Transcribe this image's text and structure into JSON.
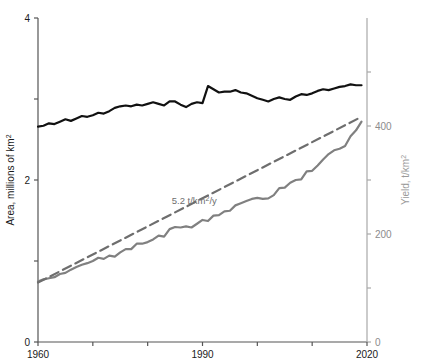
{
  "chart_data": {
    "type": "line",
    "title": "",
    "xlabel": "",
    "xlim": [
      1960,
      2020
    ],
    "xticks": [
      1960,
      1970,
      1980,
      1990,
      2000,
      2010,
      2020
    ],
    "xticklabels": [
      "1960",
      "",
      "",
      "1990",
      "",
      "",
      "2020"
    ],
    "grid": false,
    "legend": false,
    "axes": [
      {
        "id": "left",
        "label": "Area, millions of km²",
        "unit": "millions of km²",
        "lim": [
          0,
          4
        ],
        "ticks": [
          0,
          1,
          2,
          3,
          4
        ],
        "ticklabels": [
          "0",
          "",
          "2",
          "",
          "4"
        ],
        "color": "#1a1a1a"
      },
      {
        "id": "right",
        "label": "Yield, t/km²",
        "unit": "t/km²",
        "lim": [
          0,
          600
        ],
        "ticks": [
          0,
          100,
          200,
          300,
          400,
          500
        ],
        "ticklabels": [
          "0",
          "",
          "200",
          "",
          "400",
          ""
        ],
        "color": "#9a9a9a"
      }
    ],
    "annotations": [
      {
        "name": "trend-slope-label",
        "text": "5.2 t/km²/y",
        "x": 1988.5,
        "y_right": 255,
        "color": "#6e6e6e"
      }
    ],
    "series": [
      {
        "name": "Area",
        "axis": "left",
        "color": "#111111",
        "style": "solid",
        "width": 2.2,
        "x": [
          1960,
          1961,
          1962,
          1963,
          1964,
          1965,
          1966,
          1967,
          1968,
          1969,
          1970,
          1971,
          1972,
          1973,
          1974,
          1975,
          1976,
          1977,
          1978,
          1979,
          1980,
          1981,
          1982,
          1983,
          1984,
          1985,
          1986,
          1987,
          1988,
          1989,
          1990,
          1991,
          1992,
          1993,
          1994,
          1995,
          1996,
          1997,
          1998,
          1999,
          2000,
          2001,
          2002,
          2003,
          2004,
          2005,
          2006,
          2007,
          2008,
          2009,
          2010,
          2011,
          2012,
          2013,
          2014,
          2015,
          2016,
          2017,
          2018,
          2019
        ],
        "values": [
          2.66,
          2.67,
          2.7,
          2.69,
          2.72,
          2.75,
          2.73,
          2.76,
          2.79,
          2.78,
          2.8,
          2.83,
          2.82,
          2.85,
          2.89,
          2.91,
          2.92,
          2.91,
          2.93,
          2.92,
          2.94,
          2.96,
          2.94,
          2.92,
          2.97,
          2.97,
          2.93,
          2.9,
          2.94,
          2.96,
          2.95,
          3.16,
          3.12,
          3.08,
          3.09,
          3.09,
          3.11,
          3.08,
          3.07,
          3.04,
          3.01,
          2.99,
          2.97,
          3.0,
          3.02,
          3.0,
          2.99,
          3.03,
          3.06,
          3.05,
          3.07,
          3.1,
          3.12,
          3.11,
          3.13,
          3.15,
          3.16,
          3.18,
          3.17,
          3.17
        ]
      },
      {
        "name": "Yield",
        "axis": "right",
        "color": "#808080",
        "style": "solid",
        "width": 2.2,
        "x": [
          1960,
          1961,
          1962,
          1963,
          1964,
          1965,
          1966,
          1967,
          1968,
          1969,
          1970,
          1971,
          1972,
          1973,
          1974,
          1975,
          1976,
          1977,
          1978,
          1979,
          1980,
          1981,
          1982,
          1983,
          1984,
          1985,
          1986,
          1987,
          1988,
          1989,
          1990,
          1991,
          1992,
          1993,
          1994,
          1995,
          1996,
          1997,
          1998,
          1999,
          2000,
          2001,
          2002,
          2003,
          2004,
          2005,
          2006,
          2007,
          2008,
          2009,
          2010,
          2011,
          2012,
          2013,
          2014,
          2015,
          2016,
          2017,
          2018,
          2019
        ],
        "values": [
          112,
          116,
          118,
          120,
          126,
          128,
          134,
          139,
          143,
          146,
          150,
          156,
          154,
          160,
          158,
          166,
          172,
          172,
          182,
          182,
          185,
          190,
          197,
          195,
          209,
          213,
          212,
          214,
          212,
          219,
          226,
          224,
          234,
          235,
          242,
          243,
          253,
          257,
          261,
          265,
          267,
          265,
          266,
          272,
          285,
          286,
          295,
          300,
          301,
          316,
          317,
          327,
          338,
          348,
          355,
          358,
          363,
          381,
          392,
          408
        ]
      },
      {
        "name": "Yield trend",
        "axis": "right",
        "color": "#6e6e6e",
        "style": "dashed",
        "width": 2.2,
        "slope": 5.2,
        "x": [
          1960,
          2019
        ],
        "values": [
          110,
          417
        ]
      }
    ]
  }
}
